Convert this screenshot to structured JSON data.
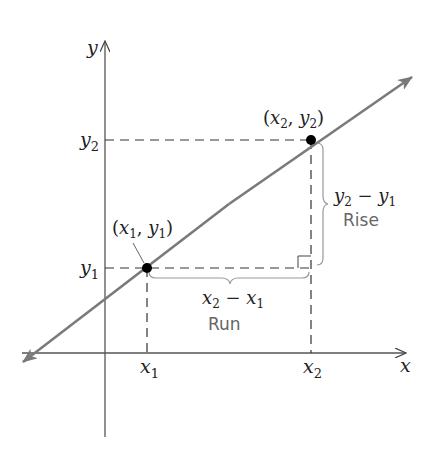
{
  "diagram": {
    "axes": {
      "x_label": "x",
      "y_label": "y"
    },
    "ticks": {
      "x1": {
        "base": "x",
        "sub": "1"
      },
      "x2": {
        "base": "x",
        "sub": "2"
      },
      "y1": {
        "base": "y",
        "sub": "1"
      },
      "y2": {
        "base": "y",
        "sub": "2"
      }
    },
    "points": [
      {
        "id": "p1",
        "label_open": "(",
        "label_a": "x",
        "sub_a": "1",
        "sep": ", ",
        "label_b": "y",
        "sub_b": "1",
        "label_close": ")"
      },
      {
        "id": "p2",
        "label_open": "(",
        "label_a": "x",
        "sub_a": "2",
        "sep": ", ",
        "label_b": "y",
        "sub_b": "2",
        "label_close": ")"
      }
    ],
    "run": {
      "expr_a": "x",
      "sub_a": "2",
      "minus": " − ",
      "expr_b": "x",
      "sub_b": "1",
      "name": "Run"
    },
    "rise": {
      "expr_a": "y",
      "sub_a": "2",
      "minus": " − ",
      "expr_b": "y",
      "sub_b": "1",
      "name": "Rise"
    },
    "colors": {
      "axis": "#555555",
      "line": "#7a7a7a",
      "dash": "#333333",
      "point": "#000000",
      "brace": "#999999",
      "sans_text": "#666666"
    }
  }
}
